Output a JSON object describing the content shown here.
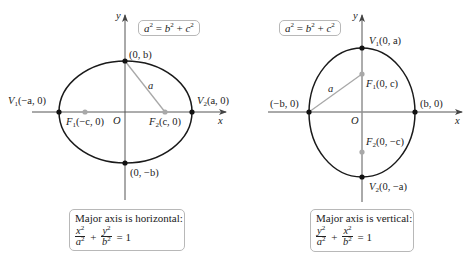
{
  "figures": [
    {
      "id": "horizontal",
      "relation": {
        "lhs": "a",
        "b": "b",
        "c": "c"
      },
      "axis_labels": {
        "x": "x",
        "y": "y",
        "origin": "O"
      },
      "points": {
        "top": "(0, b)",
        "bottom": "(0, −b)",
        "v1_prefix": "V",
        "v1_sub": "1",
        "v1_coord": "(−a, 0)",
        "v2_prefix": "V",
        "v2_sub": "2",
        "v2_coord": "(a, 0)",
        "f1_prefix": "F",
        "f1_sub": "1",
        "f1_coord": "(−c, 0)",
        "f2_prefix": "F",
        "f2_sub": "2",
        "f2_coord": "(c, 0)"
      },
      "segment_label": "a",
      "info": {
        "title": "Major axis is horizontal:",
        "term1_num": "x",
        "term1_den": "a",
        "term2_num": "y",
        "term2_den": "b",
        "rhs": "= 1"
      }
    },
    {
      "id": "vertical",
      "relation": {
        "lhs": "a",
        "b": "b",
        "c": "c"
      },
      "axis_labels": {
        "x": "x",
        "y": "y",
        "origin": "O"
      },
      "points": {
        "left": "(−b, 0)",
        "right": "(b, 0)",
        "v1_prefix": "V",
        "v1_sub": "1",
        "v1_coord": "(0, a)",
        "v2_prefix": "V",
        "v2_sub": "2",
        "v2_coord": "(0, −a)",
        "f1_prefix": "F",
        "f1_sub": "1",
        "f1_coord": "(0, c)",
        "f2_prefix": "F",
        "f2_sub": "2",
        "f2_coord": "(0, −c)"
      },
      "segment_label": "a",
      "info": {
        "title": "Major axis is vertical:",
        "term1_num": "y",
        "term1_den": "a",
        "term2_num": "x",
        "term2_den": "b",
        "rhs": "= 1"
      }
    }
  ],
  "colors": {
    "curve": "#1a1a1a",
    "axis": "#555555",
    "aux": "#a8a8a8",
    "vertex": "#111111",
    "focus": "#a8a8a8"
  }
}
